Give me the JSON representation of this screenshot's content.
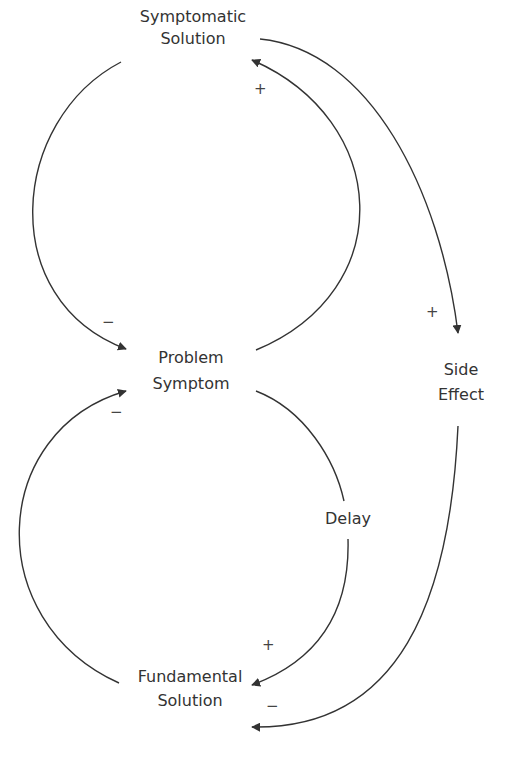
{
  "diagram": {
    "type": "causal-loop",
    "colors": {
      "line": "#333333",
      "text": "#333333",
      "background": "#ffffff"
    },
    "nodes": {
      "symptomatic_solution": {
        "line1": "Symptomatic",
        "line2": "Solution"
      },
      "problem_symptom": {
        "line1": "Problem",
        "line2": "Symptom"
      },
      "side_effect": {
        "line1": "Side",
        "line2": "Effect"
      },
      "fundamental_solution": {
        "line1": "Fundamental",
        "line2": "Solution"
      },
      "delay": {
        "label": "Delay"
      }
    },
    "links": [
      {
        "from": "Symptomatic Solution",
        "to": "Problem Symptom",
        "polarity": "−"
      },
      {
        "from": "Problem Symptom",
        "to": "Symptomatic Solution",
        "polarity": "+"
      },
      {
        "from": "Symptomatic Solution",
        "to": "Side Effect",
        "polarity": "+"
      },
      {
        "from": "Problem Symptom",
        "to": "Fundamental Solution",
        "polarity": "+",
        "delay": true
      },
      {
        "from": "Fundamental Solution",
        "to": "Problem Symptom",
        "polarity": "−"
      },
      {
        "from": "Side Effect",
        "to": "Fundamental Solution",
        "polarity": "−"
      }
    ],
    "polarity_marks": {
      "top_right_plus": "+",
      "left_top_minus": "−",
      "side_effect_plus": "+",
      "left_bottom_minus": "−",
      "bottom_plus": "+",
      "bottom_minus": "−"
    }
  }
}
